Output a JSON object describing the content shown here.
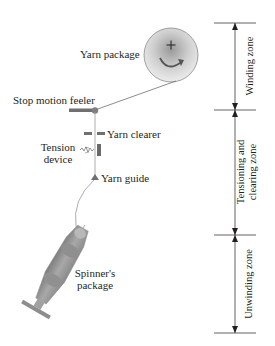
{
  "diagram": {
    "components": {
      "yarn_package": "Yarn package",
      "stop_motion_feeler": "Stop motion feeler",
      "yarn_clearer": "Yarn clearer",
      "tension_device_line1": "Tension",
      "tension_device_line2": "device",
      "yarn_guide": "Yarn guide",
      "spinners_package_line1": "Spinner's",
      "spinners_package_line2": "package"
    },
    "zones": [
      {
        "label_line1": "Winding zone",
        "label_line2": ""
      },
      {
        "label_line1": "Tensioning and",
        "label_line2": "clearing zone"
      },
      {
        "label_line1": "Unwinding zone",
        "label_line2": ""
      }
    ],
    "colors": {
      "line": "#6d6e71",
      "text": "#231f20",
      "package_dark": "#8a8a8a",
      "package_light": "#e6e6e6",
      "bobbin": "#9a9a9a"
    }
  }
}
